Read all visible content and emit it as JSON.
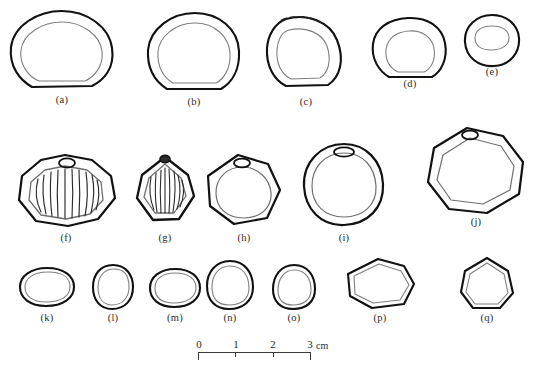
{
  "figure": {
    "type": "archaeological-line-drawing-plate",
    "background_color": "#ffffff",
    "outer_wall_color": "#111111",
    "inner_wall_color": "#7a7a7a",
    "rib_color": "#2a2a2a",
    "label_color": "#2b2b2b",
    "rows": 3,
    "specimen_count": 17
  },
  "specimens": [
    {
      "id": "a",
      "label": "(a)",
      "row": 1,
      "has_knob": false,
      "has_ribbing": false,
      "has_dashed_rim": false,
      "size_class": "large"
    },
    {
      "id": "b",
      "label": "(b)",
      "row": 1,
      "has_knob": false,
      "has_ribbing": false,
      "has_dashed_rim": false,
      "size_class": "large"
    },
    {
      "id": "c",
      "label": "(c)",
      "row": 1,
      "has_knob": false,
      "has_ribbing": false,
      "has_dashed_rim": true,
      "size_class": "medium"
    },
    {
      "id": "d",
      "label": "(d)",
      "row": 1,
      "has_knob": false,
      "has_ribbing": false,
      "has_dashed_rim": false,
      "size_class": "medium"
    },
    {
      "id": "e",
      "label": "(e)",
      "row": 1,
      "has_knob": false,
      "has_ribbing": false,
      "has_dashed_rim": false,
      "size_class": "small"
    },
    {
      "id": "f",
      "label": "(f)",
      "row": 2,
      "has_knob": true,
      "has_ribbing": true,
      "has_dashed_rim": false,
      "size_class": "large",
      "rib_count": 13
    },
    {
      "id": "g",
      "label": "(g)",
      "row": 2,
      "has_knob": true,
      "has_ribbing": true,
      "has_dashed_rim": false,
      "size_class": "medium",
      "rib_count": 11
    },
    {
      "id": "h",
      "label": "(h)",
      "row": 2,
      "has_knob": true,
      "has_ribbing": false,
      "has_dashed_rim": false,
      "size_class": "medium"
    },
    {
      "id": "i",
      "label": "(i)",
      "row": 2,
      "has_knob": true,
      "has_ribbing": false,
      "has_dashed_rim": false,
      "size_class": "large"
    },
    {
      "id": "j",
      "label": "(j)",
      "row": 2,
      "has_knob": true,
      "has_ribbing": false,
      "has_dashed_rim": false,
      "size_class": "large"
    },
    {
      "id": "k",
      "label": "(k)",
      "row": 3,
      "has_knob": false,
      "has_ribbing": false,
      "has_dashed_rim": false,
      "size_class": "small"
    },
    {
      "id": "l",
      "label": "(l)",
      "row": 3,
      "has_knob": false,
      "has_ribbing": false,
      "has_dashed_rim": false,
      "size_class": "small"
    },
    {
      "id": "m",
      "label": "(m)",
      "row": 3,
      "has_knob": false,
      "has_ribbing": false,
      "has_dashed_rim": false,
      "size_class": "small"
    },
    {
      "id": "n",
      "label": "(n)",
      "row": 3,
      "has_knob": false,
      "has_ribbing": false,
      "has_dashed_rim": false,
      "size_class": "small"
    },
    {
      "id": "o",
      "label": "(o)",
      "row": 3,
      "has_knob": false,
      "has_ribbing": false,
      "has_dashed_rim": false,
      "size_class": "small"
    },
    {
      "id": "p",
      "label": "(p)",
      "row": 3,
      "has_knob": false,
      "has_ribbing": false,
      "has_dashed_rim": false,
      "size_class": "medium"
    },
    {
      "id": "q",
      "label": "(q)",
      "row": 3,
      "has_knob": false,
      "has_ribbing": false,
      "has_dashed_rim": false,
      "size_class": "medium"
    }
  ],
  "scale_bar": {
    "unit": "cm",
    "unit_label": "cm",
    "min": 0,
    "max": 3,
    "ticks": [
      "0",
      "1",
      "2",
      "3"
    ],
    "tick_values": [
      0,
      1,
      2,
      3
    ],
    "length_px": 112,
    "left_px": 198,
    "top_px": 338
  }
}
